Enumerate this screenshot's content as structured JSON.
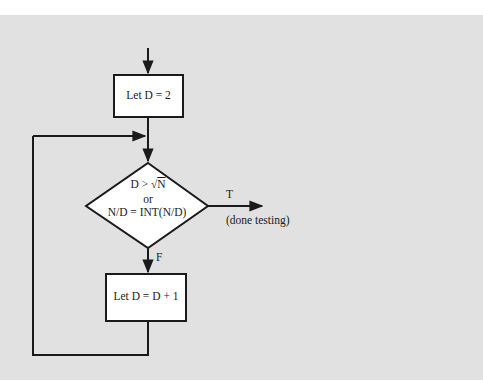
{
  "flowchart": {
    "nodes": {
      "init": {
        "type": "process",
        "text": "Let D = 2"
      },
      "decision": {
        "type": "decision",
        "line1_prefix": "D > ",
        "line1_sqrt_arg": "N",
        "line2": "or",
        "line3": "N/D = INT(N/D)"
      },
      "increment": {
        "type": "process",
        "text": "Let D = D + 1"
      }
    },
    "edges": {
      "true_label": "T",
      "true_note": "(done testing)",
      "false_label": "F"
    },
    "colors": {
      "background": "#e1e1e1",
      "stroke": "#1a1a1a",
      "box_fill": "#ffffff"
    }
  }
}
